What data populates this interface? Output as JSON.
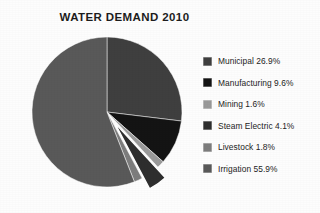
{
  "chart_data": {
    "type": "pie",
    "title": "WATER DEMAND 2010",
    "categories": [
      "Municipal",
      "Manufacturing",
      "Mining",
      "Steam Electric",
      "Livestock",
      "Irrigation"
    ],
    "values": [
      26.9,
      9.6,
      1.6,
      4.1,
      1.8,
      55.9
    ],
    "units": "percent",
    "legend_position": "right",
    "grid": false,
    "xlabel": "",
    "ylabel": "",
    "start_angle_deg": 0,
    "direction": "clockwise",
    "exploded_slices": [
      "Steam Electric"
    ],
    "slice_colors": [
      "#3f3f3f",
      "#141414",
      "#9a9a9a",
      "#2e2e2e",
      "#7d7d7d",
      "#595959"
    ],
    "background_color": "#fdfdfd",
    "title_color": "#1d1d1d",
    "slices": [
      {
        "label": "Municipal",
        "value": 26.9,
        "display": "Municipal 26.9%",
        "color": "#3f3f3f"
      },
      {
        "label": "Manufacturing",
        "value": 9.6,
        "display": "Manufacturing  9.6%",
        "color": "#141414"
      },
      {
        "label": "Mining",
        "value": 1.6,
        "display": "Mining  1.6%",
        "color": "#9a9a9a"
      },
      {
        "label": "Steam Electric",
        "value": 4.1,
        "display": "Steam Electric  4.1%",
        "color": "#2e2e2e"
      },
      {
        "label": "Livestock",
        "value": 1.8,
        "display": "Livestock  1.8%",
        "color": "#7d7d7d"
      },
      {
        "label": "Irrigation",
        "value": 55.9,
        "display": "Irrigation  55.9%",
        "color": "#595959"
      }
    ]
  },
  "legend": {
    "items": [
      {
        "label": "Municipal 26.9%"
      },
      {
        "label": "Manufacturing  9.6%"
      },
      {
        "label": "Mining  1.6%"
      },
      {
        "label": "Steam Electric  4.1%"
      },
      {
        "label": "Livestock  1.8%"
      },
      {
        "label": "Irrigation  55.9%"
      }
    ]
  }
}
